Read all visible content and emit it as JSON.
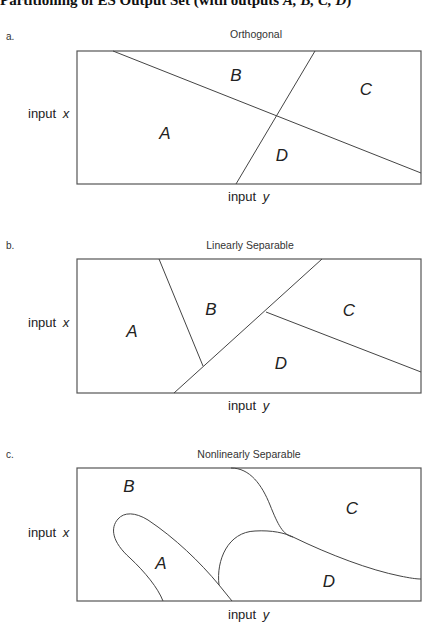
{
  "title": {
    "prefix": "Partitioning of ES Output Set (with outputs ",
    "vars": "A, B, C, D",
    "suffix": ")"
  },
  "panels": [
    {
      "tag": "a.",
      "title": "Orthogonal",
      "frame": {
        "x": 77,
        "y": 51,
        "w": 344,
        "h": 133
      },
      "title_pos": {
        "x": 256,
        "y": 38
      },
      "tag_pos": {
        "x": 6,
        "y": 40
      },
      "axis_x": {
        "text": "input",
        "var": "x",
        "x": 28,
        "y": 118
      },
      "axis_y": {
        "text": "input",
        "var": "y",
        "x": 228,
        "y": 201
      },
      "paths": [
        "M 113 51 L 421 173",
        "M 315 51 L 236 184"
      ],
      "regions": [
        {
          "label": "A",
          "x": 165,
          "y": 139
        },
        {
          "label": "B",
          "x": 236,
          "y": 81
        },
        {
          "label": "C",
          "x": 366,
          "y": 95
        },
        {
          "label": "D",
          "x": 282,
          "y": 161
        }
      ]
    },
    {
      "tag": "b.",
      "title": "Linearly Separable",
      "frame": {
        "x": 77,
        "y": 259,
        "w": 344,
        "h": 134
      },
      "title_pos": {
        "x": 250,
        "y": 249
      },
      "tag_pos": {
        "x": 6,
        "y": 249
      },
      "axis_x": {
        "text": "input",
        "var": "x",
        "x": 28,
        "y": 327
      },
      "axis_y": {
        "text": "input",
        "var": "y",
        "x": 228,
        "y": 410
      },
      "paths": [
        "M 159 259 L 203 366",
        "M 174 393 L 322 259",
        "M 266 312 L 421 372"
      ],
      "regions": [
        {
          "label": "A",
          "x": 132,
          "y": 337
        },
        {
          "label": "B",
          "x": 211,
          "y": 315
        },
        {
          "label": "C",
          "x": 349,
          "y": 316
        },
        {
          "label": "D",
          "x": 281,
          "y": 369
        }
      ]
    },
    {
      "tag": "c.",
      "title": "Nonlinearly Separable",
      "frame": {
        "x": 77,
        "y": 468,
        "w": 344,
        "h": 133
      },
      "title_pos": {
        "x": 249,
        "y": 458
      },
      "tag_pos": {
        "x": 6,
        "y": 458
      },
      "axis_x": {
        "text": "input",
        "var": "x",
        "x": 28,
        "y": 537
      },
      "axis_y": {
        "text": "input",
        "var": "y",
        "x": 228,
        "y": 619
      },
      "paths": [
        "M 231 468 C 250 468, 262 485, 270 505 C 278 525, 283 535, 293 537",
        "M 293 537 C 330 555, 370 570, 400 576 C 410 578, 416 579, 421 579",
        "M 219 585 C 216 560, 228 532, 255 531 C 272 530, 285 533, 293 537",
        "M 163 601 C 158 588, 145 572, 130 558 C 112 542, 110 528, 118 519 C 124 512, 135 512, 148 520 C 175 538, 200 562, 219 585 L 232 601"
      ],
      "regions": [
        {
          "label": "A",
          "x": 161,
          "y": 569
        },
        {
          "label": "B",
          "x": 129,
          "y": 492
        },
        {
          "label": "C",
          "x": 352,
          "y": 514
        },
        {
          "label": "D",
          "x": 329,
          "y": 587
        }
      ]
    }
  ]
}
